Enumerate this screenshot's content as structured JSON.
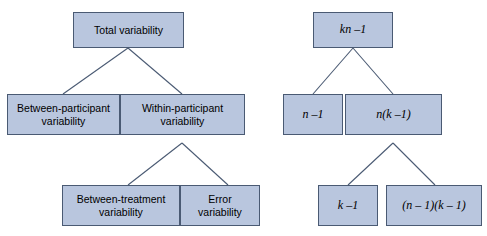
{
  "diagram": {
    "style": {
      "node_fill": "#b9c6de",
      "node_border": "#4a5a73",
      "line_color": "#4a5a73",
      "text_color": "#000000",
      "background": "#ffffff"
    },
    "left_tree": {
      "name": "variability-tree",
      "nodes": [
        {
          "id": "total-variability",
          "label": "Total variability"
        },
        {
          "id": "between-participant-variability",
          "label": "Between-participant\nvariability"
        },
        {
          "id": "within-participant-variability",
          "label": "Within-participant\nvariability"
        },
        {
          "id": "between-treatment-variability",
          "label": "Between-treatment\nvariability"
        },
        {
          "id": "error-variability",
          "label": "Error\nvariability"
        }
      ],
      "edges": [
        {
          "from": "total-variability",
          "to": "between-participant-variability"
        },
        {
          "from": "total-variability",
          "to": "within-participant-variability"
        },
        {
          "from": "within-participant-variability",
          "to": "between-treatment-variability"
        },
        {
          "from": "within-participant-variability",
          "to": "error-variability"
        }
      ]
    },
    "right_tree": {
      "name": "degrees-of-freedom-tree",
      "nodes": [
        {
          "id": "kn-minus-1",
          "label": "kn –1"
        },
        {
          "id": "n-minus-1",
          "label": "n –1"
        },
        {
          "id": "n-times-k-minus-1",
          "label": "n(k –1)"
        },
        {
          "id": "k-minus-1",
          "label": "k –1"
        },
        {
          "id": "n-minus-1-k-minus-1",
          "label": "(n – 1)(k – 1)"
        }
      ],
      "edges": [
        {
          "from": "kn-minus-1",
          "to": "n-minus-1"
        },
        {
          "from": "kn-minus-1",
          "to": "n-times-k-minus-1"
        },
        {
          "from": "n-times-k-minus-1",
          "to": "k-minus-1"
        },
        {
          "from": "n-times-k-minus-1",
          "to": "n-minus-1-k-minus-1"
        }
      ]
    }
  }
}
